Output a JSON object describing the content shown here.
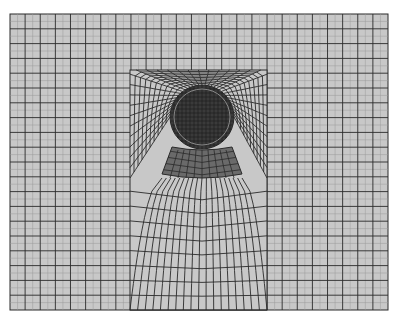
{
  "figure": {
    "type": "finite-element-mesh",
    "canvas": {
      "width": 397,
      "height": 323
    },
    "domain": {
      "x0": 10,
      "y0": 14,
      "x1": 388,
      "y1": 310
    },
    "coarse_grid": {
      "cols": 25,
      "rows": 20
    },
    "refined_block": {
      "x0": 130,
      "y0": 70,
      "x1": 267,
      "y1": 310
    },
    "inclusion": {
      "cx": 202,
      "cy": 117,
      "r": 32,
      "inner_ring_r": 28
    },
    "lower_sector": {
      "top_y": 147,
      "bottom_y": 178,
      "top_half_width": 30,
      "bottom_half_width": 40
    },
    "colors": {
      "background": "#ffffff",
      "mesh_fill": "#c8c8c8",
      "mesh_line": "#2a2a2a",
      "sub_line": "#9a9a9a",
      "inclusion_fill": "#3a3a3a",
      "inclusion_ring": "#8a8a8a",
      "sector_fill": "#6a6a6a"
    }
  }
}
